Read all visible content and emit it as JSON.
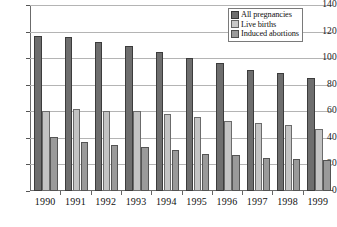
{
  "chart_data": {
    "type": "bar",
    "title": "",
    "xlabel": "",
    "ylabel": "",
    "ylim": [
      0,
      140
    ],
    "yticks": [
      0,
      20,
      40,
      60,
      80,
      100,
      120,
      140
    ],
    "grid": true,
    "legend_position": "top-right-inside",
    "categories": [
      "1990",
      "1991",
      "1992",
      "1993",
      "1994",
      "1995",
      "1996",
      "1997",
      "1998",
      "1999"
    ],
    "series": [
      {
        "name": "All pregnancies",
        "color": "#6e6e6e",
        "values": [
          117,
          116,
          112,
          109,
          105,
          100,
          96,
          91,
          89,
          85
        ]
      },
      {
        "name": "Live births",
        "color": "#c3c3c3",
        "values": [
          60,
          62,
          60,
          60,
          58,
          56,
          53,
          51,
          50,
          47
        ]
      },
      {
        "name": "Induced abortions",
        "color": "#9a9a9a",
        "values": [
          41,
          37,
          35,
          33,
          31,
          28,
          27,
          25,
          24,
          23
        ]
      }
    ]
  },
  "legend": {
    "items": [
      {
        "label": "All pregnancies"
      },
      {
        "label": "Live births"
      },
      {
        "label": "Induced abortions"
      }
    ]
  },
  "colors": {
    "series_all_pregnancies": "#6e6e6e",
    "series_live_births": "#c3c3c3",
    "series_induced_abortions": "#9a9a9a",
    "gridline": "#b4b4b4",
    "axis": "#6b6b6b",
    "background": "#ffffff"
  }
}
